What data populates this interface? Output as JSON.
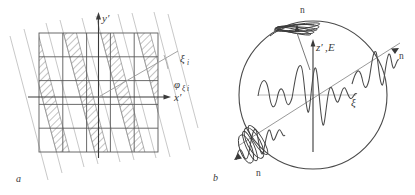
{
  "figure": {
    "type": "scientific-diagram",
    "panel_count": 2,
    "background_color": "#ffffff",
    "stroke_color": "#4a4a4a",
    "hatch_color": "#7a7a7a",
    "grid_color": "#5a5a5a",
    "light_line_color": "#a8a8a8"
  },
  "panel_a": {
    "label": "a",
    "description": "Square grid with inclined hatched bands and rotated xi axis",
    "axes": {
      "y_label": "y′",
      "x_label": "x′",
      "xi_label": "ξ",
      "xi_subscript": "i",
      "angle_label": "φ",
      "angle_subscript": "ξ i"
    },
    "grid": {
      "rows": 5,
      "cols": 5,
      "left": 39,
      "top": 33,
      "right": 158,
      "bottom": 152
    },
    "band_count": 5,
    "band_slant_deg": 14,
    "xi_axis_angle_deg": -24
  },
  "panel_b": {
    "label": "b",
    "description": "Circle containing z-prime E vertical axis, inclined xi axis and wave packets",
    "axes": {
      "z_label": "z′",
      "comma": ",",
      "E_label": "E",
      "xi_label": "ξ"
    },
    "normals": [
      {
        "id": "n-top",
        "label": "n"
      },
      {
        "id": "n-right",
        "label": "n"
      },
      {
        "id": "n-bottom-left",
        "label": "n"
      }
    ],
    "circle": {
      "cx": 313,
      "cy": 95,
      "r": 74
    },
    "xi_axis_angle_deg": -26
  }
}
